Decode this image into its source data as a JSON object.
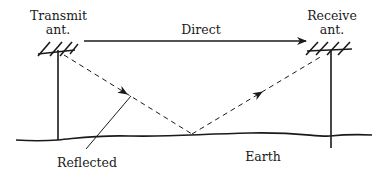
{
  "diagram": {
    "labels": {
      "transmit_line1": "Transmit",
      "transmit_line2": "ant.",
      "receive_line1": "Receive",
      "receive_line2": "ant.",
      "direct": "Direct",
      "reflected": "Reflected",
      "earth": "Earth"
    },
    "elements": {
      "transmit_antenna": {
        "x": 58,
        "mast_top": 51,
        "mast_bottom": 140
      },
      "receive_antenna": {
        "x": 330,
        "mast_top": 51,
        "mast_bottom": 150
      },
      "direct_path": {
        "from": [
          85,
          40
        ],
        "to": [
          305,
          40
        ],
        "style": "solid",
        "arrow": "end"
      },
      "reflected_path_incident": {
        "from": [
          65,
          55
        ],
        "to": [
          190,
          134
        ],
        "style": "dashed",
        "arrow": "midpoint"
      },
      "reflected_path_outgoing": {
        "from": [
          190,
          134
        ],
        "to": [
          320,
          56
        ],
        "style": "dashed",
        "arrow": "midpoint"
      },
      "ground_line": {
        "style": "wavy",
        "y": 135
      },
      "reflected_leader": {
        "from": [
          86,
          149
        ],
        "to": [
          130,
          95
        ]
      }
    },
    "colors": {
      "ink": "#1a1a1a",
      "background": "#ffffff"
    }
  }
}
